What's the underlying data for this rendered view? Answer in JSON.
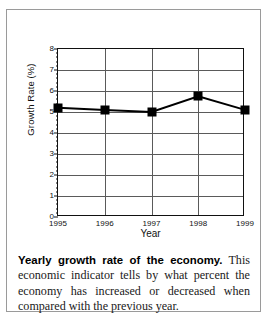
{
  "figure": {
    "caption_lead": "Yearly growth rate of the economy.",
    "caption_body": " This economic indicator tells by what percent the economy has increased or decreased when compared with the previous year."
  },
  "chart_data": {
    "type": "line",
    "title": "",
    "xlabel": "Year",
    "ylabel": "Growth Rate (%)",
    "categories": [
      "1995",
      "1996",
      "1997",
      "1998",
      "1999"
    ],
    "values": [
      5.2,
      5.1,
      5.0,
      5.75,
      5.1
    ],
    "x_tick_labels": [
      "1995",
      "1996",
      "1997",
      "1998",
      "1999"
    ],
    "y_tick_labels": [
      "0",
      "1",
      "2",
      "3",
      "4",
      "5",
      "6",
      "7",
      "8"
    ],
    "y_ticks": [
      0,
      1,
      2,
      3,
      4,
      5,
      6,
      7,
      8
    ],
    "ylim": [
      0,
      8
    ],
    "grid": "both",
    "legend": "none",
    "marker": "filled-square",
    "line_color": "#000000",
    "marker_color": "#000000",
    "grid_color": "#5a5a5a",
    "frame_color": "#111111"
  }
}
